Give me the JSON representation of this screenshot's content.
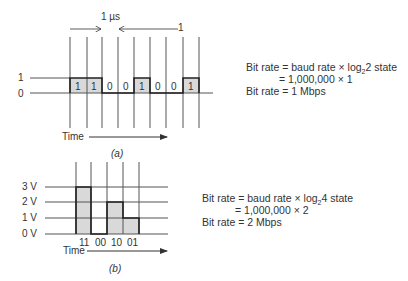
{
  "part_a": {
    "caption": "(a)",
    "duration_label": "1 µs",
    "one_marker": "1",
    "level_labels": [
      "1",
      "0"
    ],
    "bits": [
      "1",
      "1",
      "0",
      "0",
      "1",
      "0",
      "0",
      "1"
    ],
    "time_label": "Time",
    "equation": {
      "line1_prefix": "Bit rate = baud rate × log",
      "line1_sub": "2",
      "line1_suffix": "2 state",
      "line2": "= 1,000,000 × 1",
      "line3": "Bit rate = 1 Mbps"
    }
  },
  "part_b": {
    "caption": "(b)",
    "level_labels": [
      "3 V",
      "2 V",
      "1 V",
      "0 V"
    ],
    "symbols": [
      "11",
      "00",
      "10",
      "01"
    ],
    "voltages": [
      3,
      0,
      2,
      1
    ],
    "time_label": "Time",
    "equation": {
      "line1_prefix": "Bit rate = baud rate × log",
      "line1_sub": "2",
      "line1_suffix": "4 state",
      "line2": "= 1,000,000 × 2",
      "line3": "Bit rate = 2 Mbps"
    }
  },
  "colors": {
    "fill": "#d9d9d9",
    "line": "#555555",
    "signal": "#222222"
  }
}
